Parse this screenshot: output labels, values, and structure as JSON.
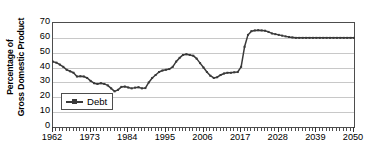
{
  "chart_data": {
    "type": "line",
    "title": "",
    "xlabel": "",
    "ylabel": "Percentage of Gross Domestic Product",
    "ylabel_lines": [
      "Percentage of",
      "Gross Domestic Product"
    ],
    "xlim": [
      1962,
      2050
    ],
    "ylim": [
      0,
      70
    ],
    "ytick_step": 10,
    "yticks": [
      70,
      60,
      50,
      40,
      30,
      20,
      10,
      0
    ],
    "xticks": [
      1962,
      1973,
      1984,
      1995,
      2006,
      2017,
      2028,
      2039,
      2050
    ],
    "xtick_minor_step": 1,
    "grid": true,
    "grid_axis": "y",
    "legend": {
      "position": "inside-bottom-left",
      "entries": [
        {
          "name": "Debt",
          "color": "#3a3a3a",
          "marker": "square",
          "line": "solid"
        }
      ]
    },
    "series": [
      {
        "name": "Debt",
        "color": "#3a3a3a",
        "x": [
          1962,
          1963,
          1964,
          1965,
          1966,
          1967,
          1968,
          1969,
          1970,
          1971,
          1972,
          1973,
          1974,
          1975,
          1976,
          1977,
          1978,
          1979,
          1980,
          1981,
          1982,
          1983,
          1984,
          1985,
          1986,
          1987,
          1988,
          1989,
          1990,
          1991,
          1992,
          1993,
          1994,
          1995,
          1996,
          1997,
          1998,
          1999,
          2000,
          2001,
          2002,
          2003,
          2004,
          2005,
          2006,
          2007,
          2008,
          2009,
          2010,
          2011,
          2012,
          2013,
          2014,
          2015,
          2016,
          2017,
          2018,
          2019,
          2020,
          2021,
          2022,
          2023,
          2024,
          2025,
          2026,
          2027,
          2028,
          2029,
          2030,
          2031,
          2032,
          2033,
          2034,
          2035,
          2036,
          2037,
          2038,
          2039,
          2040,
          2041,
          2042,
          2043,
          2044,
          2045,
          2046,
          2047,
          2048,
          2049,
          2050
        ],
        "y": [
          44.0,
          43.3,
          42.0,
          40.5,
          38.5,
          37.5,
          36.5,
          34.0,
          34.2,
          34.0,
          33.0,
          31.0,
          29.5,
          29.0,
          29.5,
          29.0,
          28.0,
          26.0,
          24.0,
          25.0,
          27.0,
          27.2,
          26.6,
          26.0,
          26.5,
          26.8,
          26.0,
          26.2,
          30.0,
          33.0,
          35.0,
          37.0,
          38.0,
          38.5,
          39.0,
          40.5,
          44.0,
          46.5,
          48.5,
          49.0,
          48.5,
          48.0,
          46.0,
          43.0,
          40.0,
          37.0,
          34.5,
          33.0,
          33.5,
          35.0,
          36.0,
          36.5,
          36.5,
          36.8,
          37.0,
          40.5,
          54.0,
          62.0,
          64.5,
          65.0,
          65.2,
          65.0,
          64.8,
          64.0,
          63.0,
          62.5,
          62.0,
          61.5,
          61.0,
          60.6,
          60.3,
          60.0,
          60.0,
          60.0,
          60.0,
          60.0,
          60.0,
          60.0,
          60.0,
          60.0,
          60.0,
          60.0,
          60.0,
          60.0,
          60.0,
          60.0,
          60.0,
          60.0,
          60.0
        ],
        "marker": "square",
        "marker_size": 2
      }
    ]
  }
}
